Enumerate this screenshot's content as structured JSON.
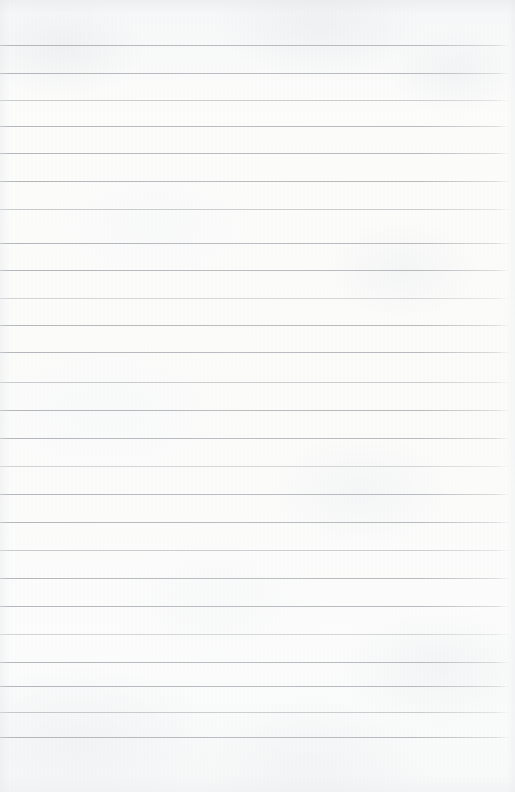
{
  "document": {
    "kind": "lined-paper-scan",
    "title": "Blank ruled notebook page",
    "page_width": 515,
    "page_height": 792,
    "text_content": "",
    "handwriting": "none",
    "printed_text": "none"
  },
  "paper": {
    "background_color": "#fbfbfa",
    "texture": "subtle mottled scan grain",
    "edge_color": "#e2e5e8"
  },
  "ruling": {
    "style": "horizontal-rules-only",
    "has_vertical_margin_rule": false,
    "line_color": "#b2b5b9",
    "line_thickness_px": 1,
    "line_spacing_px": 27.7,
    "first_line_y": 45,
    "last_line_y": 737,
    "line_start_x": 0,
    "line_end_x": 510,
    "top_margin_px": 45,
    "bottom_margin_px": 55,
    "line_count": 26,
    "lines": [
      {
        "index": 1,
        "y": 45,
        "weight": "normal"
      },
      {
        "index": 2,
        "y": 73,
        "weight": "normal"
      },
      {
        "index": 3,
        "y": 100,
        "weight": "faint"
      },
      {
        "index": 4,
        "y": 126,
        "weight": "normal"
      },
      {
        "index": 5,
        "y": 153,
        "weight": "normal"
      },
      {
        "index": 6,
        "y": 181,
        "weight": "normal"
      },
      {
        "index": 7,
        "y": 209,
        "weight": "faint"
      },
      {
        "index": 8,
        "y": 243,
        "weight": "normal"
      },
      {
        "index": 9,
        "y": 270,
        "weight": "normal"
      },
      {
        "index": 10,
        "y": 298,
        "weight": "fainter"
      },
      {
        "index": 11,
        "y": 325,
        "weight": "normal"
      },
      {
        "index": 12,
        "y": 352,
        "weight": "normal"
      },
      {
        "index": 13,
        "y": 382,
        "weight": "faint"
      },
      {
        "index": 14,
        "y": 410,
        "weight": "normal"
      },
      {
        "index": 15,
        "y": 438,
        "weight": "normal"
      },
      {
        "index": 16,
        "y": 466,
        "weight": "fainter"
      },
      {
        "index": 17,
        "y": 494,
        "weight": "normal"
      },
      {
        "index": 18,
        "y": 522,
        "weight": "normal"
      },
      {
        "index": 19,
        "y": 550,
        "weight": "faint"
      },
      {
        "index": 20,
        "y": 578,
        "weight": "normal"
      },
      {
        "index": 21,
        "y": 606,
        "weight": "normal"
      },
      {
        "index": 22,
        "y": 634,
        "weight": "fainter"
      },
      {
        "index": 23,
        "y": 662,
        "weight": "normal"
      },
      {
        "index": 24,
        "y": 686,
        "weight": "normal"
      },
      {
        "index": 25,
        "y": 712,
        "weight": "faint"
      },
      {
        "index": 26,
        "y": 737,
        "weight": "normal"
      }
    ]
  }
}
